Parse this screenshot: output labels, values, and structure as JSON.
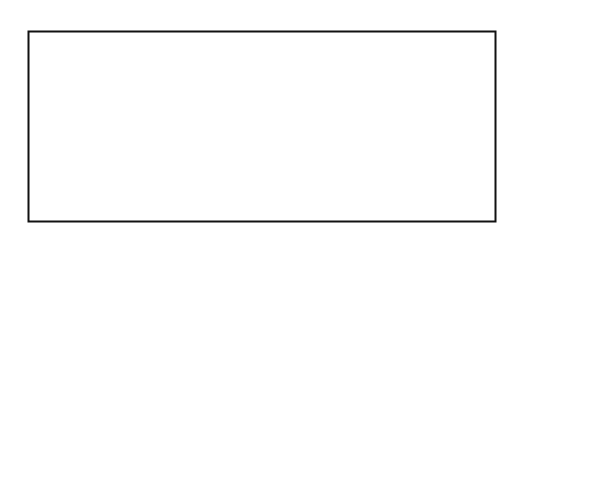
{
  "diagram": {
    "apex_label": "'Arab",
    "left_circle_label": "Ḥaḍar",
    "right_circle_label": "Badū",
    "base_left_label": "non-qabilī",
    "base_right_label": "qabilī",
    "axis_caption": "Zunahme sozialer Wertschätzung",
    "bands": [
      {
        "label": "Zuṭūṭ",
        "hatched": false
      },
      {
        "label": "Baḥārinah",
        "hatched": false
      },
      {
        "label": "'Ajam",
        "hatched": false
      },
      {
        "label": "Luwātiyah",
        "hatched": false
      },
      {
        "label": "Fawāris",
        "hatched": false
      },
      {
        "label": "Balūsh",
        "hatched": false
      },
      {
        "label": "'Abīd",
        "hatched": false
      },
      {
        "label": "'Arab",
        "hatched": true
      }
    ],
    "icons": {
      "left_circle": "hadar-pie-icon",
      "right_circle": "badu-pie-icon",
      "arrow": "right-arrow-icon"
    }
  },
  "footer": {
    "source": "Quelle: Erm. d. Verf. 1977/78",
    "code": "HA 1178"
  },
  "colors": {
    "ink": "#111111",
    "background": "#ffffff"
  }
}
